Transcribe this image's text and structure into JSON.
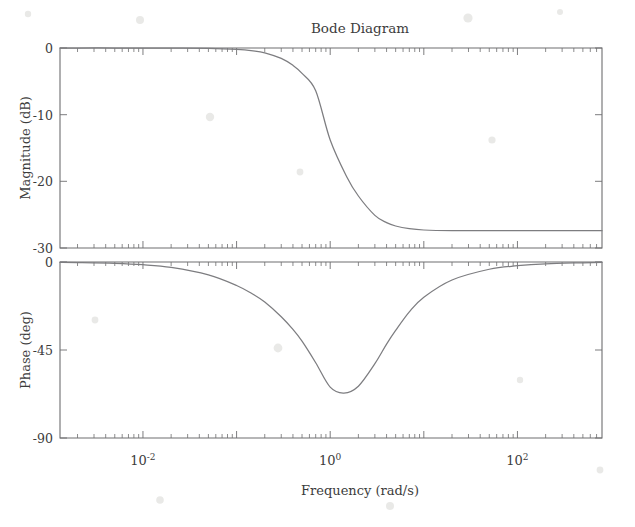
{
  "figure": {
    "title": "Bode Diagram",
    "xlabel": "Frequency (rad/s)",
    "background_color": "#ffffff",
    "line_color": "#7d7d80",
    "axis_color": "#6e6e70"
  },
  "magnitude_panel": {
    "ylabel": "Magnitude (dB)",
    "ytick_labels": [
      "0",
      "-10",
      "-20",
      "-30"
    ]
  },
  "phase_panel": {
    "ylabel": "Phase (deg)",
    "ytick_labels": [
      "0",
      "-45",
      "-90"
    ]
  },
  "xaxis": {
    "tick_labels": [
      {
        "base": "10",
        "exp": "-2"
      },
      {
        "base": "10",
        "exp": "0"
      },
      {
        "base": "10",
        "exp": "2"
      }
    ]
  },
  "chart_data": {
    "type": "line",
    "title": "Bode Diagram",
    "subtitle": "",
    "xlabel": "Frequency (rad/s)",
    "xscale": "log",
    "xlim": [
      0.0013,
      800
    ],
    "grid": false,
    "legend": null,
    "annotations": [],
    "panels": [
      {
        "name": "magnitude",
        "ylabel": "Magnitude (dB)",
        "ylim": [
          -30,
          0
        ],
        "yticks": [
          0,
          -10,
          -20,
          -30
        ],
        "series": [
          {
            "name": "magnitude",
            "x": [
              0.0013,
              0.002,
              0.005,
              0.01,
              0.02,
              0.05,
              0.1,
              0.15,
              0.2,
              0.3,
              0.4,
              0.5,
              0.7,
              1.0,
              1.5,
              2.0,
              3.0,
              4.0,
              5.0,
              7.0,
              10.0,
              20.0,
              50.0,
              100.0,
              200.0,
              500.0,
              800.0
            ],
            "y": [
              0.0,
              0.0,
              0.0,
              -0.01,
              -0.03,
              -0.06,
              -0.2,
              -0.42,
              -0.72,
              -1.56,
              -2.6,
              -3.8,
              -6.4,
              -13.8,
              -19.3,
              -22.2,
              -25.1,
              -26.2,
              -26.7,
              -27.1,
              -27.3,
              -27.4,
              -27.4,
              -27.4,
              -27.4,
              -27.4,
              -27.4
            ]
          }
        ]
      },
      {
        "name": "phase",
        "ylabel": "Phase (deg)",
        "ylim": [
          -90,
          0
        ],
        "yticks": [
          0,
          -45,
          -90
        ],
        "series": [
          {
            "name": "phase",
            "x": [
              0.0013,
              0.002,
              0.005,
              0.01,
              0.02,
              0.05,
              0.1,
              0.15,
              0.2,
              0.3,
              0.4,
              0.5,
              0.7,
              1.0,
              1.4,
              2.0,
              3.0,
              4.0,
              5.0,
              7.0,
              10.0,
              20.0,
              50.0,
              100.0,
              200.0,
              500.0,
              800.0
            ],
            "y": [
              -0.2,
              -0.3,
              -0.7,
              -1.4,
              -2.8,
              -6.6,
              -12.0,
              -16.5,
              -20.5,
              -28.0,
              -34.5,
              -40.5,
              -51.5,
              -64.0,
              -67.0,
              -63.5,
              -52.0,
              -42.0,
              -35.0,
              -25.5,
              -18.0,
              -9.2,
              -3.7,
              -1.9,
              -0.9,
              -0.4,
              -0.2
            ]
          }
        ]
      }
    ]
  }
}
